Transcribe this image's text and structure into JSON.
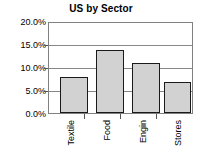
{
  "chart_data": {
    "type": "bar",
    "title": "US by Sector",
    "xlabel": "",
    "ylabel": "",
    "categories": [
      "Textile",
      "Food",
      "Engin",
      "Stores"
    ],
    "values": [
      8.0,
      14.0,
      11.0,
      7.0
    ],
    "ylim": [
      0.0,
      20.0
    ],
    "ytick_values": [
      0.0,
      5.0,
      10.0,
      15.0,
      20.0
    ],
    "ytick_labels": [
      "0.0%",
      "5.0%",
      "10.0%",
      "15.0%",
      "20.0%"
    ],
    "grid": true,
    "legend": false,
    "legend_position": "none",
    "value_suffix": "%",
    "colors": {
      "bar_fill": "#d2d2d2",
      "bar_border": "#1a1a1a",
      "gridline": "#888888",
      "frame": "#808080",
      "text": "#000000",
      "background": "#ffffff"
    }
  }
}
